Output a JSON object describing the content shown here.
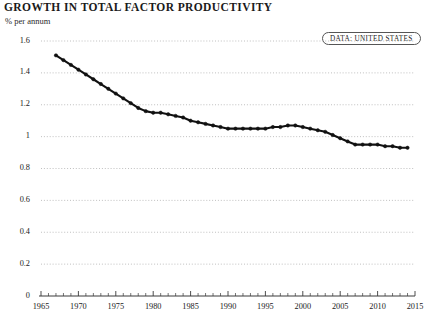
{
  "header": {
    "title": "GROWTH IN TOTAL FACTOR PRODUCTIVITY",
    "subtitle": "% per annum"
  },
  "legend": {
    "badge_label": "DATA: UNITED STATES"
  },
  "colors": {
    "line": "#111111",
    "marker": "#111111",
    "grid": "#b9b9b9",
    "axis": "#3a3a3a",
    "text": "#1a1a1a",
    "background": "#ffffff"
  },
  "chart_data": {
    "type": "line",
    "title": "GROWTH IN TOTAL FACTOR PRODUCTIVITY",
    "subtitle": "% per annum",
    "xlabel": "",
    "ylabel": "% per annum",
    "xlim": [
      1965,
      2015
    ],
    "ylim": [
      0,
      1.6
    ],
    "grid": true,
    "legend_position": "top-right",
    "y_ticks": [
      0,
      0.2,
      0.4,
      0.6,
      0.8,
      1,
      1.2,
      1.4,
      1.6
    ],
    "y_tick_labels": [
      "0",
      "0.2",
      "0.4",
      "0.6",
      "0.8",
      "1",
      "1.2",
      "1.4",
      "1.6"
    ],
    "x_ticks": [
      1965,
      1970,
      1975,
      1980,
      1985,
      1990,
      1995,
      2000,
      2005,
      2010,
      2015
    ],
    "x_tick_labels": [
      "1965",
      "1970",
      "1975",
      "1980",
      "1985",
      "1990",
      "1995",
      "2000",
      "2005",
      "2010",
      "2015"
    ],
    "x_minor_tick_step": 1,
    "series": [
      {
        "name": "DATA: UNITED STATES",
        "marker": "circle",
        "x": [
          1967,
          1968,
          1969,
          1970,
          1971,
          1972,
          1973,
          1974,
          1975,
          1976,
          1977,
          1978,
          1979,
          1980,
          1981,
          1982,
          1983,
          1984,
          1985,
          1986,
          1987,
          1988,
          1989,
          1990,
          1991,
          1992,
          1993,
          1994,
          1995,
          1996,
          1997,
          1998,
          1999,
          2000,
          2001,
          2002,
          2003,
          2004,
          2005,
          2006,
          2007,
          2008,
          2009,
          2010,
          2011,
          2012,
          2013,
          2014
        ],
        "y": [
          1.51,
          1.48,
          1.45,
          1.42,
          1.39,
          1.36,
          1.33,
          1.3,
          1.27,
          1.24,
          1.21,
          1.18,
          1.16,
          1.15,
          1.15,
          1.14,
          1.13,
          1.12,
          1.1,
          1.09,
          1.08,
          1.07,
          1.06,
          1.05,
          1.05,
          1.05,
          1.05,
          1.05,
          1.05,
          1.06,
          1.06,
          1.07,
          1.07,
          1.06,
          1.05,
          1.04,
          1.03,
          1.01,
          0.99,
          0.97,
          0.95,
          0.95,
          0.95,
          0.95,
          0.94,
          0.94,
          0.93,
          0.93
        ]
      }
    ]
  }
}
